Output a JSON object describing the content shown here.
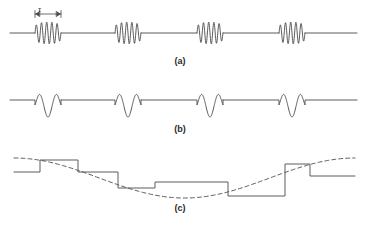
{
  "figure": {
    "background_color": "#ffffff",
    "stroke_color": "#4a4a4a",
    "text_color": "#2b2b2b",
    "width": 367,
    "height": 228
  },
  "annotations": {
    "tau_symbol": "τ",
    "tau_description": "burst duration marker with double-headed arrow"
  },
  "panels": [
    {
      "id": "a",
      "label": "(a)",
      "label_x": 180,
      "label_y": 61,
      "description": "Continuous baseline with four tone bursts of damped sinusoidal oscillation",
      "baseline_y": 33,
      "line_start_x": 10,
      "line_end_x": 357,
      "burst_count": 4,
      "burst_cycles": 5,
      "burst_amplitude": 11,
      "burst_width": 26,
      "burst_centers": [
        48,
        128,
        210,
        292
      ]
    },
    {
      "id": "b",
      "label": "(b)",
      "label_x": 180,
      "label_y": 129,
      "description": "Stepped baseline with four short oscillatory pulses of about one and a half cycles",
      "baseline_y": 100,
      "line_start_x": 10,
      "line_end_x": 357,
      "pulse_count": 4,
      "pulse_cycles": 1.5,
      "pulse_amplitude": 12,
      "pulse_width": 26,
      "pulse_centers": [
        48,
        128,
        210,
        292
      ],
      "step_height": 5
    },
    {
      "id": "c",
      "label": "(c)",
      "label_x": 180,
      "label_y": 208,
      "description": "Sample and hold staircase waveform tracking a dashed sinusoidal envelope",
      "dashed_envelope": true,
      "envelope_center_y": 178,
      "envelope_amplitude": 20,
      "envelope_start_x": 14,
      "envelope_end_x": 355,
      "envelope_cycles": 1.0,
      "envelope_phase_deg": 90,
      "steps": [
        {
          "x_start": 14,
          "x_end": 40,
          "y": 172
        },
        {
          "x_start": 40,
          "x_end": 78,
          "y": 160
        },
        {
          "x_start": 78,
          "x_end": 118,
          "y": 172
        },
        {
          "x_start": 118,
          "x_end": 155,
          "y": 188
        },
        {
          "x_start": 155,
          "x_end": 228,
          "y": 182
        },
        {
          "x_start": 228,
          "x_end": 285,
          "y": 196
        },
        {
          "x_start": 285,
          "x_end": 310,
          "y": 164
        },
        {
          "x_start": 310,
          "x_end": 355,
          "y": 176
        }
      ]
    }
  ]
}
